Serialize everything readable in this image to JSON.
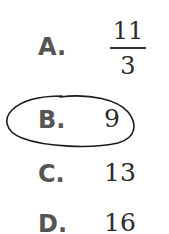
{
  "question": {
    "options": [
      {
        "letter": "A.",
        "numerator": "11",
        "denominator": "3",
        "selected": false
      },
      {
        "letter": "B.",
        "value": "9",
        "selected": true
      },
      {
        "letter": "C.",
        "value": "13",
        "selected": false
      },
      {
        "letter": "D.",
        "value": "16",
        "selected": false
      }
    ],
    "selection_mark": "hand-drawn-oval"
  },
  "colors": {
    "letter": "#555555",
    "value": "#2a2a2a",
    "mark": "#1a1a1a",
    "background": "#ffffff"
  }
}
